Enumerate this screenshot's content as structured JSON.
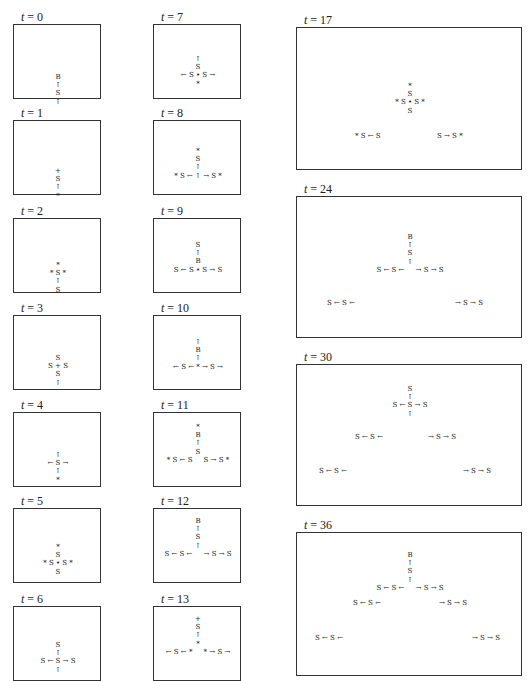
{
  "figure": {
    "header_fragment": "'",
    "label_var": "t",
    "label_eq": " = ",
    "panels": [
      {
        "t": "0",
        "rows": [
          [
            "B"
          ],
          [
            "↑"
          ],
          [
            "S"
          ],
          [
            "↑"
          ]
        ]
      },
      {
        "t": "1",
        "rows": [
          [
            "+"
          ],
          [
            "S"
          ],
          [
            "↑"
          ],
          [
            "*"
          ]
        ]
      },
      {
        "t": "2",
        "rows": [
          [
            "*"
          ],
          [
            "* S *"
          ],
          [
            "↑"
          ],
          [
            "S"
          ]
        ]
      },
      {
        "t": "3",
        "rows": [
          [
            "S"
          ],
          [
            "S + S"
          ],
          [
            "S"
          ],
          [
            "↑"
          ]
        ]
      },
      {
        "t": "4",
        "rows": [
          [
            "↑"
          ],
          [
            "← S →"
          ],
          [
            "↑"
          ],
          [
            "*"
          ]
        ]
      },
      {
        "t": "5",
        "rows": [
          [
            "*"
          ],
          [
            "S"
          ],
          [
            "* S • S *"
          ],
          [
            "S"
          ]
        ]
      },
      {
        "t": "6",
        "rows": [
          [
            "S"
          ],
          [
            "↑"
          ],
          [
            "S ← S → S"
          ],
          [
            "↑"
          ]
        ]
      },
      {
        "t": "7",
        "rows": [
          [
            "↑"
          ],
          [
            "S"
          ],
          [
            "← S • S →"
          ],
          [
            "*"
          ]
        ]
      },
      {
        "t": "8",
        "rows": [
          [
            "*"
          ],
          [
            "S"
          ],
          [
            "↑"
          ],
          [
            "* S ← ↑ → S *"
          ]
        ]
      },
      {
        "t": "9",
        "rows": [
          [
            "S"
          ],
          [
            "↑"
          ],
          [
            "B"
          ],
          [
            "S ← S • S → S"
          ]
        ]
      },
      {
        "t": "10",
        "rows": [
          [
            "↑"
          ],
          [
            "B"
          ],
          [
            "↑"
          ],
          [
            "← S ← * → S →"
          ]
        ]
      },
      {
        "t": "11",
        "rows": [
          [
            "*"
          ],
          [
            "B"
          ],
          [
            "↑"
          ],
          [
            "S"
          ],
          [
            "* S ← S     S → S *"
          ]
        ]
      },
      {
        "t": "12",
        "rows": [
          [
            "B"
          ],
          [
            "↑"
          ],
          [
            "S"
          ],
          [
            "↑"
          ],
          [
            "S ← S ←     → S → S"
          ]
        ]
      },
      {
        "t": "13",
        "rows": [
          [
            "+"
          ],
          [
            "S"
          ],
          [
            "↑"
          ],
          [
            "*"
          ],
          [
            "← S ← *     * → S →"
          ]
        ]
      },
      {
        "t": "17",
        "rows": [
          [
            "*"
          ],
          [
            "S"
          ],
          [
            "* S • S *"
          ],
          [
            "S"
          ]
        ],
        "extra": [
          [
            "* S ← S",
            "S → S *"
          ]
        ]
      },
      {
        "t": "24",
        "rows": [
          [
            "B"
          ],
          [
            "↑"
          ],
          [
            "S"
          ],
          [
            "↑"
          ],
          [
            "S ← S ←     → S → S"
          ]
        ],
        "extra": [
          [
            "S ← S ←",
            "→ S → S"
          ]
        ]
      },
      {
        "t": "30",
        "rows": [
          [
            "S"
          ],
          [
            "↑"
          ],
          [
            "S ← S → S"
          ],
          [
            "↑"
          ]
        ],
        "extra": [
          [
            "S ← S ←",
            "→ S → S"
          ],
          [
            "S ← S ←",
            "→ S → S"
          ]
        ]
      },
      {
        "t": "36",
        "rows": [
          [
            "B"
          ],
          [
            "↑"
          ],
          [
            "S"
          ],
          [
            "↑"
          ],
          [
            "S ← S ←     → S → S"
          ]
        ],
        "extra": [
          [
            "S ← S ←",
            "→ S → S"
          ],
          [
            "S ← S ←",
            "→ S → S"
          ]
        ]
      }
    ]
  }
}
